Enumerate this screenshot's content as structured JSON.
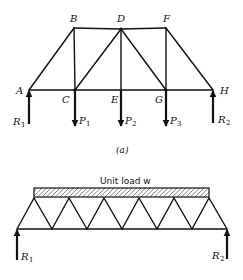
{
  "figure_a": {
    "caption": "(a)",
    "nodes": {
      "A": {
        "label": "A",
        "x": 29,
        "y": 90
      },
      "B": {
        "label": "B",
        "x": 74,
        "y": 28
      },
      "C": {
        "label": "C",
        "x": 75,
        "y": 90
      },
      "D": {
        "label": "D",
        "x": 121,
        "y": 29
      },
      "E": {
        "label": "E",
        "x": 121,
        "y": 90
      },
      "F": {
        "label": "F",
        "x": 166,
        "y": 28
      },
      "G": {
        "label": "G",
        "x": 166,
        "y": 90
      },
      "H": {
        "label": "H",
        "x": 213,
        "y": 90
      }
    },
    "members": [
      [
        "A",
        "B"
      ],
      [
        "B",
        "D"
      ],
      [
        "D",
        "F"
      ],
      [
        "F",
        "H"
      ],
      [
        "A",
        "C"
      ],
      [
        "C",
        "E"
      ],
      [
        "E",
        "G"
      ],
      [
        "G",
        "H"
      ],
      [
        "B",
        "C"
      ],
      [
        "C",
        "D"
      ],
      [
        "D",
        "E"
      ],
      [
        "D",
        "G"
      ],
      [
        "F",
        "G"
      ]
    ],
    "loads": [
      {
        "name": "P",
        "sub": "1",
        "at": "C",
        "direction": "down"
      },
      {
        "name": "P",
        "sub": "2",
        "at": "E",
        "direction": "down"
      },
      {
        "name": "P",
        "sub": "3",
        "at": "G",
        "direction": "down"
      }
    ],
    "reactions": [
      {
        "name": "R",
        "sub": "1",
        "at": "A",
        "direction": "up"
      },
      {
        "name": "R",
        "sub": "2",
        "at": "H",
        "direction": "up"
      }
    ]
  },
  "figure_b": {
    "load_label": "Unit load w",
    "top_chord_x": [
      34,
      69,
      104,
      139,
      174,
      209
    ],
    "bottom_chord_x": [
      17,
      52,
      87,
      122,
      157,
      192,
      227
    ],
    "reactions": [
      {
        "name": "R",
        "sub": "1",
        "direction": "up"
      },
      {
        "name": "R",
        "sub": "2",
        "direction": "up"
      }
    ]
  }
}
